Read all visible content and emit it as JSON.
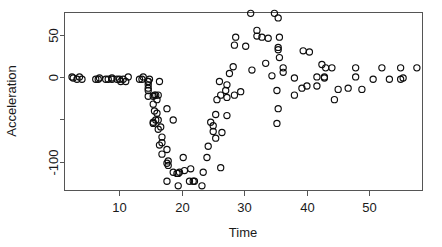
{
  "chart_data": {
    "type": "scatter",
    "title": "",
    "xlabel": "Time",
    "ylabel": "Acceleration",
    "xlim": [
      1.2,
      58.5
    ],
    "ylim": [
      -134,
      76
    ],
    "grid": false,
    "legend": null,
    "marker": "open-circle",
    "marker_color": "#0d0d0d",
    "xticks": [
      10,
      20,
      30,
      40,
      50
    ],
    "xtick_labels": [
      "10",
      "20",
      "30",
      "40",
      "50"
    ],
    "yticks": [
      50,
      0,
      -50,
      -100
    ],
    "ytick_labels": [
      "50",
      "0",
      "",
      "-100"
    ],
    "n_points": 133,
    "points": [
      [
        2.4,
        0.0
      ],
      [
        2.6,
        -1.3
      ],
      [
        3.2,
        -2.7
      ],
      [
        3.6,
        0.0
      ],
      [
        4.0,
        -2.7
      ],
      [
        6.2,
        -2.7
      ],
      [
        6.6,
        -2.7
      ],
      [
        6.8,
        -1.3
      ],
      [
        7.8,
        -2.7
      ],
      [
        8.2,
        -2.7
      ],
      [
        8.8,
        -1.3
      ],
      [
        8.8,
        -2.7
      ],
      [
        9.6,
        -2.7
      ],
      [
        10.0,
        -2.7
      ],
      [
        10.2,
        -5.4
      ],
      [
        10.6,
        -2.7
      ],
      [
        11.0,
        -5.4
      ],
      [
        11.4,
        0.0
      ],
      [
        13.2,
        -2.7
      ],
      [
        13.6,
        -2.7
      ],
      [
        13.8,
        0.0
      ],
      [
        14.6,
        -13.3
      ],
      [
        14.6,
        -5.4
      ],
      [
        14.6,
        -5.4
      ],
      [
        14.6,
        -9.3
      ],
      [
        14.6,
        -16.0
      ],
      [
        14.6,
        -22.8
      ],
      [
        14.8,
        -2.7
      ],
      [
        15.4,
        -22.8
      ],
      [
        15.4,
        -32.1
      ],
      [
        15.4,
        -53.5
      ],
      [
        15.4,
        -54.9
      ],
      [
        15.6,
        -40.2
      ],
      [
        15.6,
        -21.5
      ],
      [
        15.8,
        -21.5
      ],
      [
        15.8,
        -50.8
      ],
      [
        16.0,
        -42.9
      ],
      [
        16.0,
        -26.8
      ],
      [
        16.2,
        -21.5
      ],
      [
        16.2,
        -50.8
      ],
      [
        16.2,
        -61.7
      ],
      [
        16.4,
        -5.4
      ],
      [
        16.4,
        -80.4
      ],
      [
        16.6,
        -59.0
      ],
      [
        16.8,
        -71.0
      ],
      [
        16.8,
        -91.1
      ],
      [
        16.8,
        -77.7
      ],
      [
        17.6,
        -37.5
      ],
      [
        17.6,
        -85.6
      ],
      [
        17.6,
        -123.1
      ],
      [
        17.6,
        -101.9
      ],
      [
        17.8,
        -99.1
      ],
      [
        17.8,
        -104.4
      ],
      [
        18.6,
        -112.5
      ],
      [
        18.6,
        -50.8
      ],
      [
        19.2,
        -113.8
      ],
      [
        19.4,
        -113.8
      ],
      [
        19.4,
        -128.5
      ],
      [
        19.6,
        -112.5
      ],
      [
        20.2,
        -95.1
      ],
      [
        20.4,
        -110.5
      ],
      [
        21.2,
        -123.1
      ],
      [
        21.4,
        -108.4
      ],
      [
        21.8,
        -123.1
      ],
      [
        22.0,
        -123.1
      ],
      [
        23.2,
        -128.5
      ],
      [
        23.4,
        -112.5
      ],
      [
        24.0,
        -95.1
      ],
      [
        24.2,
        -81.8
      ],
      [
        24.6,
        -53.5
      ],
      [
        25.0,
        -64.4
      ],
      [
        25.0,
        -57.6
      ],
      [
        25.4,
        -72.3
      ],
      [
        25.4,
        -44.3
      ],
      [
        25.6,
        -26.8
      ],
      [
        26.0,
        -5.4
      ],
      [
        26.2,
        -107.1
      ],
      [
        26.2,
        -21.5
      ],
      [
        26.4,
        -65.6
      ],
      [
        27.0,
        -16.0
      ],
      [
        27.2,
        -45.6
      ],
      [
        27.2,
        -24.2
      ],
      [
        27.2,
        -9.3
      ],
      [
        27.6,
        4.0
      ],
      [
        28.2,
        12.0
      ],
      [
        28.4,
        -21.5
      ],
      [
        28.4,
        37.5
      ],
      [
        28.6,
        46.9
      ],
      [
        29.4,
        -17.4
      ],
      [
        30.2,
        36.2
      ],
      [
        31.0,
        75.0
      ],
      [
        31.2,
        8.1
      ],
      [
        32.0,
        54.9
      ],
      [
        32.0,
        48.2
      ],
      [
        32.8,
        46.9
      ],
      [
        33.4,
        16.0
      ],
      [
        33.8,
        45.6
      ],
      [
        34.4,
        1.3
      ],
      [
        34.8,
        75.0
      ],
      [
        35.2,
        -16.0
      ],
      [
        35.2,
        -54.9
      ],
      [
        35.4,
        69.6
      ],
      [
        35.4,
        34.8
      ],
      [
        35.4,
        32.1
      ],
      [
        35.4,
        -37.5
      ],
      [
        35.6,
        22.8
      ],
      [
        35.6,
        46.9
      ],
      [
        36.2,
        10.7
      ],
      [
        36.2,
        5.4
      ],
      [
        38.0,
        -1.3
      ],
      [
        38.0,
        -21.5
      ],
      [
        39.2,
        -13.3
      ],
      [
        39.4,
        30.8
      ],
      [
        40.0,
        -10.7
      ],
      [
        40.4,
        29.4
      ],
      [
        41.6,
        0.0
      ],
      [
        41.6,
        -10.7
      ],
      [
        42.4,
        14.7
      ],
      [
        42.8,
        -1.3
      ],
      [
        42.8,
        0.0
      ],
      [
        43.0,
        10.7
      ],
      [
        44.0,
        10.7
      ],
      [
        44.4,
        -26.8
      ],
      [
        45.0,
        -14.7
      ],
      [
        46.6,
        -13.3
      ],
      [
        47.8,
        0.0
      ],
      [
        47.8,
        10.7
      ],
      [
        48.8,
        -14.7
      ],
      [
        50.6,
        -2.7
      ],
      [
        52.0,
        10.7
      ],
      [
        53.2,
        -2.7
      ],
      [
        55.0,
        10.7
      ],
      [
        55.0,
        -2.7
      ],
      [
        55.4,
        -1.3
      ],
      [
        57.6,
        10.7
      ]
    ]
  },
  "axes": {
    "x_axis_label": "Time",
    "y_axis_label": "Acceleration"
  }
}
